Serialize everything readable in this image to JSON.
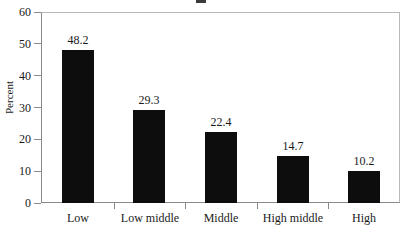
{
  "chart_data": {
    "type": "bar",
    "title": "",
    "xlabel": "",
    "ylabel": "Percent",
    "categories": [
      "Low",
      "Low middle",
      "Middle",
      "High middle",
      "High"
    ],
    "values": [
      48.2,
      29.3,
      22.4,
      14.7,
      10.2
    ],
    "value_labels": [
      "48.2",
      "29.3",
      "22.4",
      "14.7",
      "10.2"
    ],
    "ylim": [
      0,
      60
    ],
    "ytick_step": 10,
    "ytick_labels": [
      "0",
      "10",
      "20",
      "30",
      "40",
      "50",
      "60"
    ],
    "grid": false,
    "legend": false,
    "legend_position": "none",
    "bar_color": "#0d0d0d",
    "background_color": "#ffffff",
    "axis_color": "#8a8a8a",
    "frame_color": "#b9b9b9",
    "text_color": "#1a1a1a"
  },
  "axis": {
    "y_title": "Percent"
  }
}
